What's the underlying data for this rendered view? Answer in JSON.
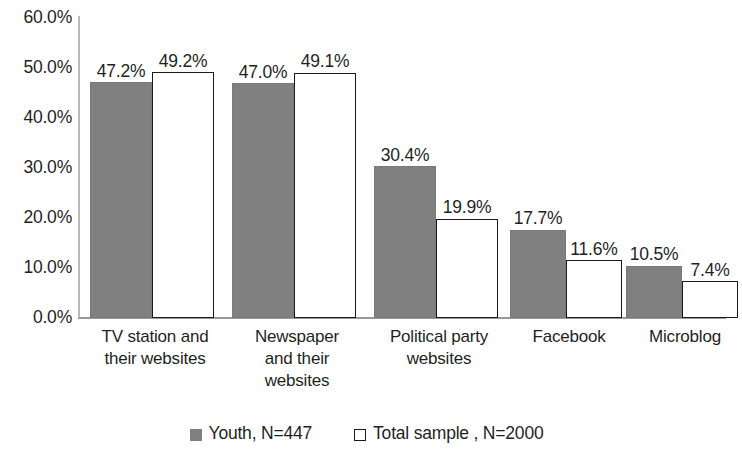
{
  "chart_data": {
    "type": "bar",
    "title": "",
    "subtitle": "",
    "xlabel": "",
    "ylabel": "",
    "ylim": [
      0,
      60
    ],
    "ytick_labels": [
      "60.0%",
      "50.0%",
      "40.0%",
      "30.0%",
      "20.0%",
      "10.0%",
      "0.0%"
    ],
    "ytick_values": [
      60,
      50,
      40,
      30,
      20,
      10,
      0
    ],
    "grid": false,
    "legend_position": "bottom",
    "categories": [
      "TV station and their websites",
      "Newspaper and their websites",
      "Political party websites",
      "Facebook",
      "Microblog"
    ],
    "category_lines": [
      [
        "TV station and",
        "their websites"
      ],
      [
        "Newspaper",
        "and their",
        "websites"
      ],
      [
        "Political party",
        "websites"
      ],
      [
        "Facebook"
      ],
      [
        "Microblog"
      ]
    ],
    "series": [
      {
        "name": "Youth, N=447",
        "color": "#808080",
        "style": "filled",
        "values": [
          47.2,
          47.0,
          30.4,
          17.7,
          10.5
        ],
        "labels": [
          "47.2%",
          "47.0%",
          "30.4%",
          "17.7%",
          "10.5%"
        ]
      },
      {
        "name": "Total sample , N=2000",
        "color": "#ffffff",
        "style": "hollow",
        "values": [
          49.2,
          49.1,
          19.9,
          11.6,
          7.4
        ],
        "labels": [
          "49.2%",
          "49.1%",
          "19.9%",
          "11.6%",
          "7.4%"
        ]
      }
    ]
  },
  "legend": {
    "items": [
      {
        "label": "Youth, N=447",
        "style": "filled"
      },
      {
        "label": "Total sample , N=2000",
        "style": "hollow"
      }
    ]
  }
}
